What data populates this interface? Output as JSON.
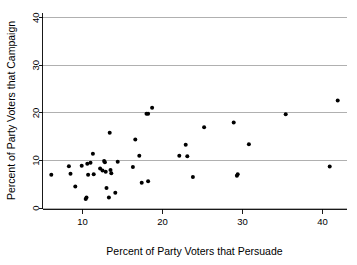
{
  "chart_data": {
    "type": "scatter",
    "title": "",
    "xlabel": "Percent of Party Voters that Persuade",
    "ylabel": "Percent of Party Voters that Campaign",
    "xlim": [
      5,
      43
    ],
    "ylim": [
      0,
      41
    ],
    "xticks": [
      10,
      20,
      30,
      40
    ],
    "yticks": [
      0,
      10,
      20,
      30,
      40
    ],
    "xtick_labels": [
      "10",
      "20",
      "30",
      "40"
    ],
    "ytick_labels": [
      "0",
      "10",
      "20",
      "30",
      "40"
    ],
    "grid": "horizontal",
    "legend": "none",
    "marker": "filled-circle",
    "marker_color": "#000000",
    "point_count": 45,
    "points": [
      {
        "x": 6.1,
        "y": 7.0
      },
      {
        "x": 8.3,
        "y": 8.8
      },
      {
        "x": 8.5,
        "y": 7.2
      },
      {
        "x": 9.1,
        "y": 4.5
      },
      {
        "x": 9.9,
        "y": 8.9
      },
      {
        "x": 10.4,
        "y": 1.9
      },
      {
        "x": 10.5,
        "y": 2.2
      },
      {
        "x": 10.6,
        "y": 9.3
      },
      {
        "x": 10.7,
        "y": 7.0
      },
      {
        "x": 11.0,
        "y": 9.5
      },
      {
        "x": 11.3,
        "y": 11.4
      },
      {
        "x": 11.4,
        "y": 7.1
      },
      {
        "x": 12.2,
        "y": 8.3
      },
      {
        "x": 12.5,
        "y": 7.9
      },
      {
        "x": 12.7,
        "y": 9.9
      },
      {
        "x": 12.8,
        "y": 9.6
      },
      {
        "x": 12.9,
        "y": 7.6
      },
      {
        "x": 13.0,
        "y": 4.2
      },
      {
        "x": 13.3,
        "y": 2.2
      },
      {
        "x": 13.4,
        "y": 15.8
      },
      {
        "x": 13.5,
        "y": 8.0
      },
      {
        "x": 13.6,
        "y": 7.3
      },
      {
        "x": 14.1,
        "y": 3.2
      },
      {
        "x": 14.4,
        "y": 9.7
      },
      {
        "x": 16.3,
        "y": 8.6
      },
      {
        "x": 16.6,
        "y": 14.4
      },
      {
        "x": 17.1,
        "y": 11.0
      },
      {
        "x": 17.4,
        "y": 5.3
      },
      {
        "x": 18.0,
        "y": 19.8
      },
      {
        "x": 18.2,
        "y": 19.8
      },
      {
        "x": 18.2,
        "y": 5.6
      },
      {
        "x": 18.7,
        "y": 21.1
      },
      {
        "x": 22.1,
        "y": 11.0
      },
      {
        "x": 22.9,
        "y": 13.3
      },
      {
        "x": 23.1,
        "y": 10.9
      },
      {
        "x": 23.8,
        "y": 6.5
      },
      {
        "x": 25.2,
        "y": 17.0
      },
      {
        "x": 28.9,
        "y": 18.0
      },
      {
        "x": 29.3,
        "y": 6.8
      },
      {
        "x": 29.4,
        "y": 7.1
      },
      {
        "x": 30.8,
        "y": 13.4
      },
      {
        "x": 35.4,
        "y": 19.7
      },
      {
        "x": 40.9,
        "y": 8.7
      },
      {
        "x": 41.9,
        "y": 22.6
      }
    ]
  }
}
